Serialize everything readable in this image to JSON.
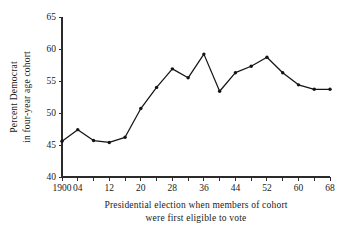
{
  "chart_data": {
    "type": "line",
    "title": "",
    "subtitle": "",
    "xlabel_line1": "Presidential election when members of cohort",
    "xlabel_line2": "were first eligible to vote",
    "ylabel_line1": "Percent Democrat",
    "ylabel_line2": "in four-year age cohort",
    "x": [
      1900,
      1904,
      1908,
      1912,
      1916,
      1920,
      1924,
      1928,
      1932,
      1936,
      1940,
      1944,
      1948,
      1952,
      1956,
      1960,
      1964,
      1968
    ],
    "values": [
      45.6,
      47.4,
      45.7,
      45.4,
      46.2,
      50.7,
      54.0,
      56.9,
      55.5,
      59.2,
      53.4,
      56.3,
      57.3,
      58.7,
      56.3,
      54.4,
      53.7,
      53.7
    ],
    "series": [
      {
        "name": "Percent Democrat in four-year age cohort",
        "values": [
          45.6,
          47.4,
          45.7,
          45.4,
          46.2,
          50.7,
          54.0,
          56.9,
          55.5,
          59.2,
          53.4,
          56.3,
          57.3,
          58.7,
          56.3,
          54.4,
          53.7,
          53.7
        ]
      }
    ],
    "xlim": [
      1900,
      1968
    ],
    "ylim": [
      40,
      65
    ],
    "ytick_values": [
      40,
      45,
      50,
      55,
      60,
      65
    ],
    "ytick_labels": [
      "40",
      "45",
      "50",
      "55",
      "60",
      "65"
    ],
    "xtick_values": [
      1900,
      1904,
      1908,
      1912,
      1916,
      1920,
      1924,
      1928,
      1932,
      1936,
      1940,
      1944,
      1948,
      1952,
      1956,
      1960,
      1964,
      1968
    ],
    "xtick_labeled": [
      {
        "value": 1900,
        "label": "1900"
      },
      {
        "value": 1904,
        "label": "04"
      },
      {
        "value": 1912,
        "label": "12"
      },
      {
        "value": 1920,
        "label": "20"
      },
      {
        "value": 1928,
        "label": "28"
      },
      {
        "value": 1936,
        "label": "36"
      },
      {
        "value": 1944,
        "label": "44"
      },
      {
        "value": 1952,
        "label": "52"
      },
      {
        "value": 1960,
        "label": "60"
      },
      {
        "value": 1968,
        "label": "68"
      }
    ],
    "grid": false,
    "legend": false,
    "legend_position": "none",
    "marker": "filled-circle",
    "line_color": "#141414",
    "marker_color": "#141414",
    "axis_color": "#2b2b2b",
    "background_color": "#ffffff"
  }
}
